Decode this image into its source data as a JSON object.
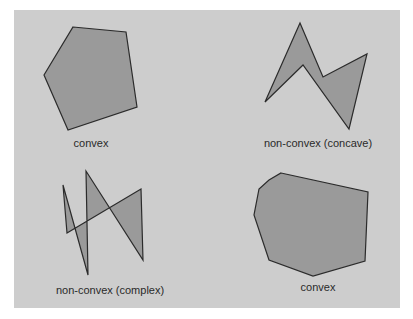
{
  "diagram": {
    "colors": {
      "background": "#ffffff",
      "panel": "#cdcdcd",
      "polygon_fill": "#9a9a9a",
      "polygon_stroke": "#2b2b2b",
      "label_text": "#2a2a2a"
    },
    "polygons": [
      {
        "id": "convex-pentagon",
        "label": "convex",
        "points": "73,27 126,32 137,107 68,130 44,75",
        "label_x": 91,
        "label_y": 147
      },
      {
        "id": "concave-zigzag",
        "label": "non-convex (concave)",
        "points": "300,23 323,77 367,54 349,129 303,65 265,102",
        "label_x": 318,
        "label_y": 147
      },
      {
        "id": "complex-self-intersecting",
        "label": "non-convex (complex)",
        "points": "63,185 88,275 86,171 143,260 141,189 67,233",
        "label_x": 110,
        "label_y": 294
      },
      {
        "id": "convex-heptagon",
        "label": "convex",
        "points": "281,173 368,192 365,261 313,276 269,260 254,215 259,189 269,180",
        "label_x": 318,
        "label_y": 291
      }
    ]
  }
}
